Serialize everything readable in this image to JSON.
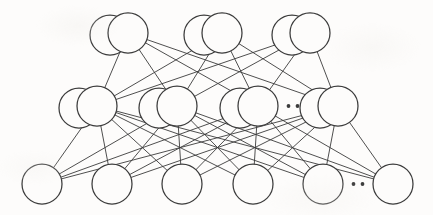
{
  "figure": {
    "kind": "neural-network-diagram",
    "background_color": "#fdfcfb",
    "stroke_color": "#3b3b3b",
    "node_fill_color": "#fdfcfb",
    "canvas": {
      "width": 433,
      "height": 215
    }
  },
  "style": {
    "node_radius": 20,
    "back_circle_offset_x": -18,
    "back_circle_offset_y": 2,
    "edge_stroke_width": 0.9,
    "node_stroke_width": 1.25,
    "ellipsis_dot_radius": 1.9
  },
  "layers": [
    {
      "id": "output-layer",
      "name": "output-layer",
      "row": 0,
      "y": 33,
      "stacked": true,
      "node_count": 3,
      "nodes": [
        {
          "id": "out-1",
          "name": "output-node-1",
          "cx": 128,
          "cy": 33,
          "r": 20,
          "stacked": true
        },
        {
          "id": "out-2",
          "name": "output-node-2",
          "cx": 222,
          "cy": 33,
          "r": 20,
          "stacked": true
        },
        {
          "id": "out-3",
          "name": "output-node-3",
          "cx": 310,
          "cy": 33,
          "r": 20,
          "stacked": true
        }
      ],
      "ellipsis": null
    },
    {
      "id": "hidden-layer",
      "name": "hidden-layer",
      "row": 1,
      "y": 106,
      "stacked": true,
      "node_count": 4,
      "nodes": [
        {
          "id": "hid-1",
          "name": "hidden-node-1",
          "cx": 97,
          "cy": 106,
          "r": 20,
          "stacked": true
        },
        {
          "id": "hid-2",
          "name": "hidden-node-2",
          "cx": 177,
          "cy": 106,
          "r": 20,
          "stacked": true
        },
        {
          "id": "hid-3",
          "name": "hidden-node-3",
          "cx": 258,
          "cy": 106,
          "r": 20,
          "stacked": true
        },
        {
          "id": "hid-4",
          "name": "hidden-node-4",
          "cx": 338,
          "cy": 106,
          "r": 20,
          "stacked": true
        }
      ],
      "ellipsis": {
        "name": "hidden-layer-ellipsis",
        "dots": 2,
        "cx": 293,
        "cy": 106,
        "spacing": 9
      }
    },
    {
      "id": "input-layer",
      "name": "input-layer",
      "row": 2,
      "y": 184,
      "stacked": false,
      "node_count": 6,
      "nodes": [
        {
          "id": "in-1",
          "name": "input-node-1",
          "cx": 42,
          "cy": 184,
          "r": 20,
          "stacked": false
        },
        {
          "id": "in-2",
          "name": "input-node-2",
          "cx": 112,
          "cy": 184,
          "r": 20,
          "stacked": false
        },
        {
          "id": "in-3",
          "name": "input-node-3",
          "cx": 182,
          "cy": 184,
          "r": 20,
          "stacked": false
        },
        {
          "id": "in-4",
          "name": "input-node-4",
          "cx": 253,
          "cy": 184,
          "r": 20,
          "stacked": false
        },
        {
          "id": "in-5",
          "name": "input-node-5",
          "cx": 323,
          "cy": 184,
          "r": 20,
          "stacked": false
        },
        {
          "id": "in-6",
          "name": "input-node-6",
          "cx": 393,
          "cy": 184,
          "r": 20,
          "stacked": false
        }
      ],
      "ellipsis": {
        "name": "input-layer-ellipsis",
        "dots": 2,
        "cx": 358,
        "cy": 184,
        "spacing": 9
      }
    }
  ],
  "connections": [
    {
      "from_layer": "input-layer",
      "to_layer": "hidden-layer",
      "pattern": "fully-connected"
    },
    {
      "from_layer": "hidden-layer",
      "to_layer": "output-layer",
      "pattern": "fully-connected"
    }
  ]
}
